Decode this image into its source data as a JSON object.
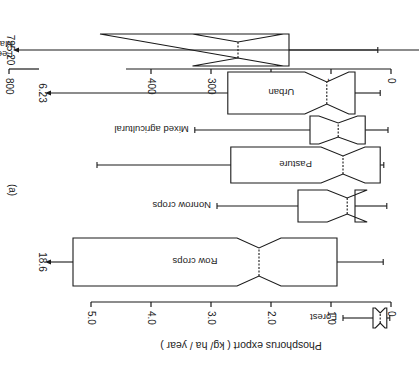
{
  "chart_data": {
    "type": "box",
    "orientation_in_image": "rotated 180 degrees (upside-down)",
    "panel_label": "(a)",
    "ylabel": "Phosphorus export ( kg/ ha / year )",
    "main_axis": {
      "ylim": [
        0,
        5.0
      ],
      "ticks": [
        "0",
        "1.0",
        "2.0",
        "3.0",
        "4.0",
        "5.0"
      ]
    },
    "feedlot_axis": {
      "ylim": [
        0,
        800
      ],
      "ticks": [
        "0",
        "100",
        "200",
        "300",
        "400",
        "800"
      ],
      "note": "broken axis between 400 and 800"
    },
    "categories": [
      "Forest",
      "Row crops",
      "Nonrow crops",
      "Pasture",
      "Mixed agricultural",
      "Urban",
      "Feedlot Manure storage"
    ],
    "boxes": [
      {
        "label": "Forest",
        "min": 0.02,
        "q1": 0.07,
        "median": 0.18,
        "q3": 0.3,
        "max": 0.8,
        "notched": true
      },
      {
        "label": "Row crops",
        "min": 0.13,
        "q1": 0.9,
        "median": 2.2,
        "q3": 5.3,
        "max": 18.6,
        "max_label": "18.6",
        "max_offscale": true,
        "notched": true
      },
      {
        "label": "Nonrow crops",
        "min": 0.07,
        "q1": 0.6,
        "median": 0.73,
        "q3": 1.55,
        "max": 2.9,
        "notched": true
      },
      {
        "label": "Pasture",
        "min": 0.12,
        "q1": 0.18,
        "median": 0.8,
        "q3": 2.67,
        "max": 4.9,
        "notched": true
      },
      {
        "label": "Mixed agricultural",
        "min": 0.05,
        "q1": 0.43,
        "median": 0.88,
        "q3": 1.35,
        "max": 3.27,
        "notched": true
      },
      {
        "label": "Urban",
        "min": 0.18,
        "q1": 0.6,
        "median": 1.07,
        "q3": 2.72,
        "max": 6.23,
        "max_label": "6.23",
        "max_offscale": true,
        "notched": true
      },
      {
        "label": "Feedlot Manure storage",
        "label_lines": [
          "Feedlot",
          "Manure storage"
        ],
        "min": 22,
        "q1": 170,
        "median": 255,
        "q3": 427,
        "max": 795.2,
        "max_label": "795.20",
        "max_offscale": true,
        "notched": true,
        "axis": "feedlot_axis"
      }
    ]
  }
}
